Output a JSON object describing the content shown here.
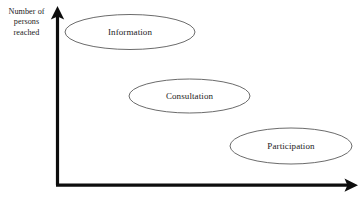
{
  "diagram": {
    "background_color": "#ffffff",
    "axis_color": "#0d0d0d",
    "ellipse_stroke_color": "#5a5a5a",
    "text_color": "#1b1b1b",
    "axes": {
      "y_axis": {
        "name": "vertical-axis",
        "label_lines": [
          "Number of",
          "persons",
          "reached"
        ],
        "label_full": "Number of persons reached",
        "arrow_direction": "up"
      },
      "x_axis": {
        "name": "horizontal-axis",
        "label_full": "Degree of involvement",
        "label_visible_fragment": "",
        "label_clipped": true,
        "arrow_direction": "right"
      }
    },
    "bubbles": [
      {
        "id": "information",
        "label": "Information",
        "level": 1,
        "cx": 130,
        "cy": 32,
        "rx": 65,
        "ry": 17.5
      },
      {
        "id": "consultation",
        "label": "Consultation",
        "level": 2,
        "cx": 189.5,
        "cy": 96,
        "rx": 60.5,
        "ry": 17
      },
      {
        "id": "participation",
        "label": "Participation",
        "level": 3,
        "cx": 291,
        "cy": 146,
        "rx": 61,
        "ry": 18
      }
    ]
  }
}
